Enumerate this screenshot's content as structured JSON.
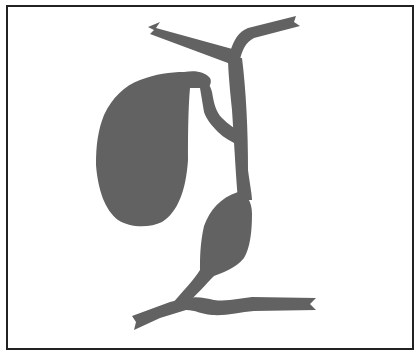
{
  "diagram": {
    "colors": {
      "background": "#ffffff",
      "frame": "#222222",
      "organ_fill": "#626262"
    },
    "parts": [
      {
        "id": "left-hepatic-duct"
      },
      {
        "id": "right-hepatic-duct"
      },
      {
        "id": "common-hepatic-duct"
      },
      {
        "id": "gallbladder"
      },
      {
        "id": "cystic-duct"
      },
      {
        "id": "common-bile-duct"
      },
      {
        "id": "duodenal-duct-segment"
      }
    ]
  }
}
